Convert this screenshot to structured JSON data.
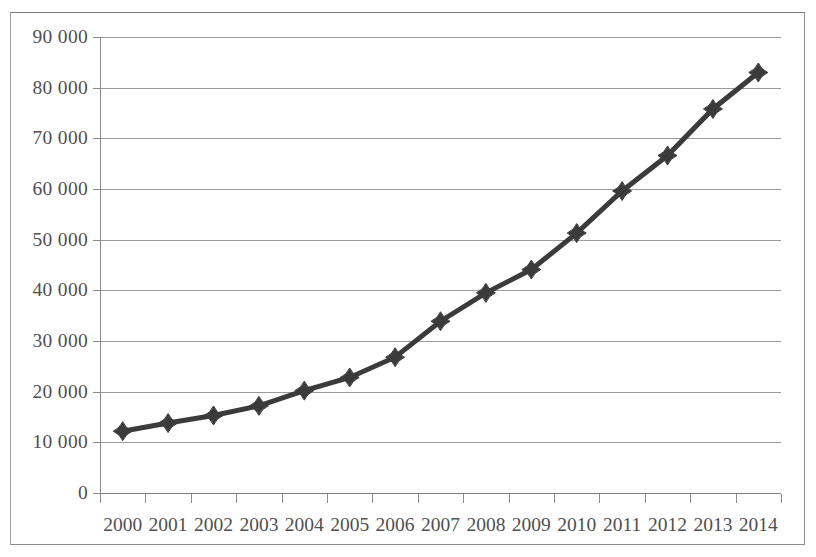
{
  "chart_data": {
    "type": "line",
    "title": "",
    "subtitle": "",
    "xlabel": "",
    "ylabel": "",
    "categories": [
      "2000",
      "2001",
      "2002",
      "2003",
      "2004",
      "2005",
      "2006",
      "2007",
      "2008",
      "2009",
      "2010",
      "2011",
      "2012",
      "2013",
      "2014"
    ],
    "values": [
      12200,
      13800,
      15300,
      17200,
      20200,
      22800,
      26800,
      33900,
      39500,
      44100,
      51300,
      59600,
      66600,
      75800,
      83000
    ],
    "series": [
      {
        "name": "",
        "values": [
          12200,
          13800,
          15300,
          17200,
          20200,
          22800,
          26800,
          33900,
          39500,
          44100,
          51300,
          59600,
          66600,
          75800,
          83000
        ]
      }
    ],
    "ylim": [
      0,
      90000
    ],
    "ytick_values": [
      0,
      10000,
      20000,
      30000,
      40000,
      50000,
      60000,
      70000,
      80000,
      90000
    ],
    "ytick_labels": [
      "0",
      "10 000",
      "20 000",
      "30 000",
      "40 000",
      "50 000",
      "60 000",
      "70 000",
      "80 000",
      "90 000"
    ],
    "xtick_labels": [
      "2000",
      "2001",
      "2002",
      "2003",
      "2004",
      "2005",
      "2006",
      "2007",
      "2008",
      "2009",
      "2010",
      "2011",
      "2012",
      "2013",
      "2014"
    ],
    "grid": true,
    "grid_axis": "y",
    "legend": false,
    "legend_position": "none",
    "marker": "diamond",
    "line_color": "#3b3b3b",
    "marker_color": "#3b3b3b",
    "grid_color": "#9b9b9b",
    "axis_color": "#8a8a8a",
    "text_color": "#4f4f4f",
    "background_color": "#ffffff",
    "frame_color": "#8d8d8d"
  }
}
